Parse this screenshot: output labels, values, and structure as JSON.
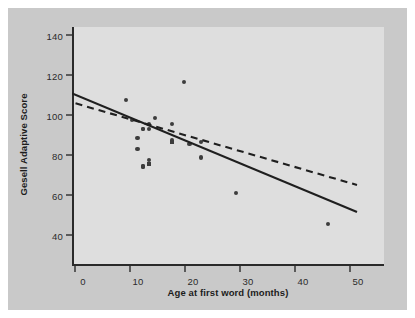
{
  "figure": {
    "background": "#ffffff",
    "panel_color": "#c9c9c9",
    "plot_color": "#dedede",
    "axis_color": "#2a2a2a",
    "marker_color": "#3d3d3d"
  },
  "legend": {
    "position": "top-right",
    "entries": [
      {
        "marker": "circle-marker",
        "equals": "=",
        "label": "One child"
      },
      {
        "marker": "square-marker",
        "equals": "=",
        "label": "Two children"
      }
    ]
  },
  "annotations": [
    {
      "name": "child-19-label",
      "text": "Child 19",
      "x": 17.5,
      "y": 127
    },
    {
      "name": "child-18-label",
      "text": "Child 18",
      "x": 42,
      "y": 50
    }
  ],
  "chart_data": {
    "type": "scatter",
    "title": "",
    "subtitle": "",
    "xlabel": "Age at first word (months)",
    "ylabel": "Gesell Adaptive Score",
    "xlim": [
      -2,
      52
    ],
    "ylim": [
      38,
      146
    ],
    "xticks": [
      0,
      10,
      20,
      30,
      40,
      50
    ],
    "yticks": [
      40,
      60,
      80,
      100,
      120,
      140
    ],
    "grid": false,
    "legend_position": "top right",
    "series": [
      {
        "name": "One child",
        "marker": "circle",
        "points": [
          {
            "x": 15,
            "y": 95
          },
          {
            "x": 26,
            "y": 71
          },
          {
            "x": 10,
            "y": 83
          },
          {
            "x": 9,
            "y": 91
          },
          {
            "x": 15,
            "y": 102
          },
          {
            "x": 20,
            "y": 87
          },
          {
            "x": 18,
            "y": 93
          },
          {
            "x": 11,
            "y": 100
          },
          {
            "x": 8,
            "y": 104
          },
          {
            "x": 20,
            "y": 94
          },
          {
            "x": 7,
            "y": 113
          },
          {
            "x": 9,
            "y": 96
          },
          {
            "x": 10,
            "y": 83
          },
          {
            "x": 11,
            "y": 84
          },
          {
            "x": 11,
            "y": 102
          },
          {
            "x": 10,
            "y": 100
          },
          {
            "x": 12,
            "y": 105
          },
          {
            "x": 42,
            "y": 57
          },
          {
            "x": 17,
            "y": 121
          },
          {
            "x": 11,
            "y": 86
          },
          {
            "x": 10,
            "y": 100
          }
        ]
      },
      {
        "name": "Two children",
        "marker": "square",
        "points": [
          {
            "x": 11,
            "y": 84
          },
          {
            "x": 15,
            "y": 94
          }
        ]
      }
    ],
    "lines": [
      {
        "name": "all-children-regression",
        "style": "solid",
        "label": "All children",
        "x": [
          -2,
          51
        ],
        "y": [
          112.5,
          51.5
        ]
      },
      {
        "name": "without-child-18-regression",
        "style": "dashed",
        "label": "Without Child 18",
        "x": [
          -2,
          51
        ],
        "y": [
          107.5,
          65
        ]
      }
    ]
  }
}
